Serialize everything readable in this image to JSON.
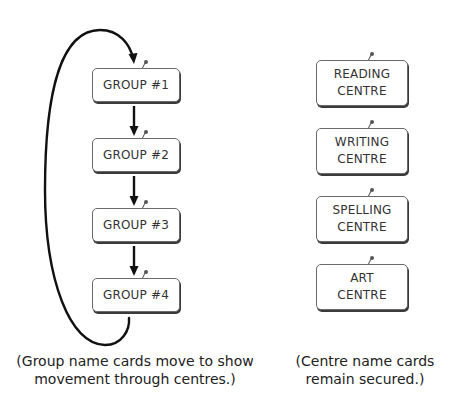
{
  "group_cards": [
    {
      "label": "GROUP #1"
    },
    {
      "label": "GROUP #2"
    },
    {
      "label": "GROUP #3"
    },
    {
      "label": "GROUP #4"
    }
  ],
  "centre_cards": [
    {
      "line1": "READING",
      "line2": "CENTRE"
    },
    {
      "line1": "WRITING",
      "line2": "CENTRE"
    },
    {
      "line1": "SPELLING",
      "line2": "CENTRE"
    },
    {
      "line1": "ART",
      "line2": "CENTRE"
    }
  ],
  "captions": {
    "left": {
      "line1": "(Group name cards move to show",
      "line2": "movement through centres.)"
    },
    "right": {
      "line1": "(Centre name cards",
      "line2": "remain secured.)"
    }
  },
  "colors": {
    "arrow": "#111111",
    "card_border": "#6a6a6a",
    "card_shadow": "#3a3a3a",
    "text": "#333333"
  }
}
